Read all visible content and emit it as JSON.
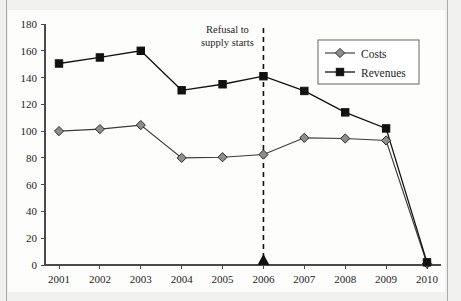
{
  "chart_data": {
    "type": "line",
    "title": "",
    "subtitle": "",
    "xlabel": "",
    "ylabel": "",
    "categories": [
      "2001",
      "2002",
      "2003",
      "2004",
      "2005",
      "2006",
      "2007",
      "2008",
      "2009",
      "2010"
    ],
    "x_tick_labels": [
      "2001",
      "2002",
      "2003",
      "2004",
      "2005",
      "2006",
      "2007",
      "2008",
      "2009",
      "2010"
    ],
    "y_tick_labels": [
      "0",
      "20",
      "40",
      "60",
      "80",
      "100",
      "120",
      "140",
      "160",
      "180"
    ],
    "y_ticks": [
      0,
      20,
      40,
      60,
      80,
      100,
      120,
      140,
      160,
      180
    ],
    "ylim": [
      0,
      180
    ],
    "grid": false,
    "legend_position": "top-right",
    "series": [
      {
        "name": "Costs",
        "marker": "diamond",
        "color": "#8e8e8e",
        "values": [
          100,
          101.5,
          104.5,
          80,
          80.5,
          82.5,
          95,
          94.5,
          93,
          1
        ]
      },
      {
        "name": "Revenues",
        "marker": "square",
        "color": "#111111",
        "values": [
          150.5,
          155,
          160,
          130.5,
          135,
          141,
          130,
          114,
          102,
          2
        ]
      }
    ],
    "annotations": [
      {
        "name": "refusal-to-supply-annotation",
        "text_line_1": "Refusal to",
        "text_line_2": "supply starts",
        "at_category": "2006",
        "marker": "triangle-up-on-axis",
        "line_style": "dashed-vertical"
      }
    ]
  },
  "legend": {
    "items": [
      {
        "label": "Costs"
      },
      {
        "label": "Revenues"
      }
    ]
  },
  "colors": {
    "costs": "#8e8e8e",
    "revenues": "#111111",
    "axis": "#4a4a4a",
    "paper": "#fdfdfc",
    "page_background": "#f1f1ef"
  }
}
